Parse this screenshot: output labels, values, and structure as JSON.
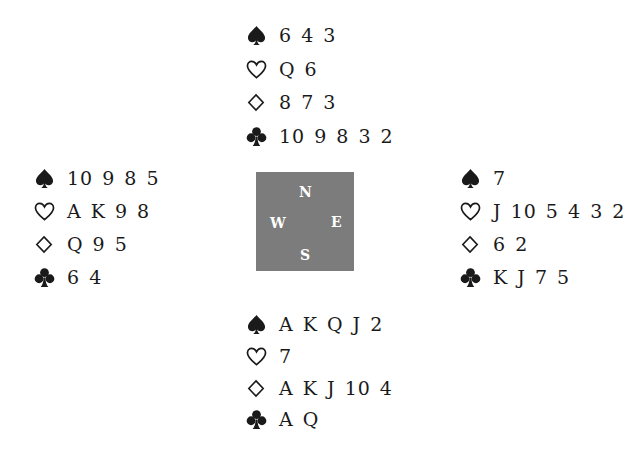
{
  "deal": {
    "north": {
      "spades": "6 4 3",
      "hearts": "Q 6",
      "diamonds": "8 7 3",
      "clubs": "10 9 8 3 2"
    },
    "west": {
      "spades": "10 9 8 5",
      "hearts": "A K 9 8",
      "diamonds": "Q 9 5",
      "clubs": "6 4"
    },
    "east": {
      "spades": "7",
      "hearts": "J 10 5 4 3 2",
      "diamonds": "6 2",
      "clubs": "K J 7 5"
    },
    "south": {
      "spades": "A K Q J 2",
      "hearts": "7",
      "diamonds": "A K J 10 4",
      "clubs": "A Q"
    }
  },
  "compass": {
    "n": "N",
    "e": "E",
    "s": "S",
    "w": "W",
    "color": "#7c7c7c"
  },
  "suits": {
    "spades": "spade-icon",
    "hearts": "heart-icon",
    "diamonds": "diamond-icon",
    "clubs": "club-icon"
  }
}
